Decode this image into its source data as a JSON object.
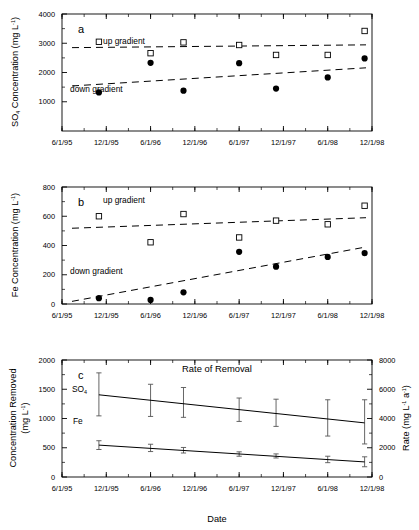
{
  "figure": {
    "name": "three-panel-time-series-figure",
    "xlabel": "Date",
    "x_tick_labels": [
      "6/1/95",
      "12/1/95",
      "6/1/96",
      "12/1/96",
      "6/1/97",
      "12/1/97",
      "6/1/98",
      "12/1/98"
    ],
    "colors": {
      "ink": "#000000",
      "line": "#404040",
      "marker_open": "#ffffff"
    }
  },
  "panels": {
    "a": {
      "letter": "a",
      "ylabel_main": "SO",
      "ylabel_sub": "4",
      "ylabel_rest": " Concentration (mg L",
      "ylabel_sup": "-1",
      "ylabel_end": ")",
      "up_label": "up gradient",
      "down_label": "down gradient",
      "y_tick_labels": [
        "1000",
        "2000",
        "3000",
        "4000"
      ]
    },
    "b": {
      "letter": "b",
      "ylabel_rest": "Fe Concentration (mg L",
      "ylabel_sup": "-1",
      "ylabel_end": ")",
      "up_label": "up gradient",
      "down_label": "down gradient",
      "y_tick_labels": [
        "0",
        "200",
        "400",
        "600",
        "800"
      ]
    },
    "c": {
      "letter": "c",
      "title": "Rate of Removal",
      "ylabel_left_line1": "Concentration Removed",
      "ylabel_left_line2_pre": "(mg L",
      "ylabel_left_sup": "-1",
      "ylabel_left_end": ")",
      "ylabel_right_pre": "Rate (mg L",
      "ylabel_right_sup1": "-1",
      "ylabel_right_mid": " a",
      "ylabel_right_sup2": "-1",
      "ylabel_right_end": ")",
      "so4_label": "SO",
      "so4_sub": "4",
      "fe_label": "Fe",
      "y_tick_labels_left": [
        "0",
        "500",
        "1000",
        "1500",
        "2000"
      ],
      "y_tick_labels_right": [
        "0",
        "2000",
        "4000",
        "6000",
        "8000"
      ]
    }
  },
  "chart_data": [
    {
      "type": "scatter",
      "panel": "a",
      "title": "",
      "xlabel": "Date",
      "ylabel": "SO4 Concentration (mg L-1)",
      "ylim": [
        0,
        4000
      ],
      "yticks": [
        1000,
        2000,
        3000,
        4000
      ],
      "xlim": [
        "6/1/95",
        "12/1/98"
      ],
      "xticks": [
        "6/1/95",
        "12/1/95",
        "6/1/96",
        "12/1/96",
        "6/1/97",
        "12/1/97",
        "6/1/98",
        "12/1/98"
      ],
      "grid": false,
      "legend_position": "in-plot-annotations",
      "series": [
        {
          "name": "up gradient",
          "marker": "open-square",
          "points": [
            {
              "x": "11/1/95",
              "y": 3050
            },
            {
              "x": "6/1/96",
              "y": 2660
            },
            {
              "x": "10/15/96",
              "y": 3030
            },
            {
              "x": "6/1/97",
              "y": 2940
            },
            {
              "x": "11/1/97",
              "y": 2600
            },
            {
              "x": "6/1/98",
              "y": 2600
            },
            {
              "x": "11/1/98",
              "y": 3420
            }
          ],
          "trend": {
            "style": "dashed",
            "y_start": 2850,
            "y_end": 2945
          }
        },
        {
          "name": "down gradient",
          "marker": "filled-circle",
          "points": [
            {
              "x": "11/1/95",
              "y": 1320
            },
            {
              "x": "6/1/96",
              "y": 2330
            },
            {
              "x": "10/15/96",
              "y": 1380
            },
            {
              "x": "6/1/97",
              "y": 2320
            },
            {
              "x": "11/1/97",
              "y": 1450
            },
            {
              "x": "6/1/98",
              "y": 1830
            },
            {
              "x": "11/1/98",
              "y": 2480
            }
          ],
          "trend": {
            "style": "dashed",
            "y_start": 1540,
            "y_end": 2160
          }
        }
      ]
    },
    {
      "type": "scatter",
      "panel": "b",
      "title": "",
      "xlabel": "Date",
      "ylabel": "Fe Concentration (mg L-1)",
      "ylim": [
        0,
        800
      ],
      "yticks": [
        0,
        200,
        400,
        600,
        800
      ],
      "xlim": [
        "6/1/95",
        "12/1/98"
      ],
      "xticks": [
        "6/1/95",
        "12/1/95",
        "6/1/96",
        "12/1/96",
        "6/1/97",
        "12/1/97",
        "6/1/98",
        "12/1/98"
      ],
      "grid": false,
      "legend_position": "in-plot-annotations",
      "series": [
        {
          "name": "up gradient",
          "marker": "open-square",
          "points": [
            {
              "x": "11/1/95",
              "y": 600
            },
            {
              "x": "6/1/96",
              "y": 422
            },
            {
              "x": "10/15/96",
              "y": 615
            },
            {
              "x": "6/1/97",
              "y": 455
            },
            {
              "x": "11/1/97",
              "y": 570
            },
            {
              "x": "6/1/98",
              "y": 545
            },
            {
              "x": "11/1/98",
              "y": 672
            }
          ],
          "trend": {
            "style": "dashed",
            "y_start": 518,
            "y_end": 590
          }
        },
        {
          "name": "down gradient",
          "marker": "filled-circle",
          "points": [
            {
              "x": "11/1/95",
              "y": 40
            },
            {
              "x": "6/1/96",
              "y": 28
            },
            {
              "x": "10/15/96",
              "y": 80
            },
            {
              "x": "6/1/97",
              "y": 357
            },
            {
              "x": "11/1/97",
              "y": 255
            },
            {
              "x": "6/1/98",
              "y": 322
            },
            {
              "x": "11/1/98",
              "y": 348
            }
          ],
          "trend": {
            "style": "dashed",
            "y_start": 18,
            "y_end": 390
          }
        }
      ]
    },
    {
      "type": "line",
      "panel": "c",
      "title": "Rate of Removal",
      "xlabel": "Date",
      "ylabel": "Concentration Removed (mg L-1)",
      "ylabel_secondary": "Rate (mg L-1 a-1)",
      "ylim": [
        0,
        2000
      ],
      "yticks": [
        0,
        500,
        1000,
        1500,
        2000
      ],
      "ylim_secondary": [
        0,
        8000
      ],
      "yticks_secondary": [
        0,
        2000,
        4000,
        6000,
        8000
      ],
      "xlim": [
        "6/1/95",
        "12/1/98"
      ],
      "xticks": [
        "6/1/95",
        "12/1/95",
        "6/1/96",
        "12/1/96",
        "6/1/97",
        "12/1/97",
        "6/1/98",
        "12/1/98"
      ],
      "grid": false,
      "error_bars": true,
      "series": [
        {
          "name": "SO4",
          "points": [
            {
              "x": "11/1/95",
              "y": 1405,
              "yerr_low": 1045,
              "yerr_high": 1780
            },
            {
              "x": "6/1/96",
              "y": 1310,
              "yerr_low": 1035,
              "yerr_high": 1585
            },
            {
              "x": "10/15/96",
              "y": 1255,
              "yerr_low": 1020,
              "yerr_high": 1530
            },
            {
              "x": "6/1/97",
              "y": 1140,
              "yerr_low": 950,
              "yerr_high": 1350
            },
            {
              "x": "11/1/97",
              "y": 1075,
              "yerr_low": 865,
              "yerr_high": 1330
            },
            {
              "x": "6/1/98",
              "y": 985,
              "yerr_low": 700,
              "yerr_high": 1320
            },
            {
              "x": "11/1/98",
              "y": 925,
              "yerr_low": 565,
              "yerr_high": 1320
            }
          ]
        },
        {
          "name": "Fe",
          "points": [
            {
              "x": "11/1/95",
              "y": 545,
              "yerr_low": 470,
              "yerr_high": 620
            },
            {
              "x": "6/1/96",
              "y": 500,
              "yerr_low": 435,
              "yerr_high": 560
            },
            {
              "x": "10/15/96",
              "y": 458,
              "yerr_low": 410,
              "yerr_high": 505
            },
            {
              "x": "6/1/97",
              "y": 393,
              "yerr_low": 355,
              "yerr_high": 430
            },
            {
              "x": "11/1/97",
              "y": 360,
              "yerr_low": 325,
              "yerr_high": 395
            },
            {
              "x": "6/1/98",
              "y": 303,
              "yerr_low": 245,
              "yerr_high": 355
            },
            {
              "x": "11/1/98",
              "y": 258,
              "yerr_low": 175,
              "yerr_high": 345
            }
          ]
        }
      ]
    }
  ]
}
